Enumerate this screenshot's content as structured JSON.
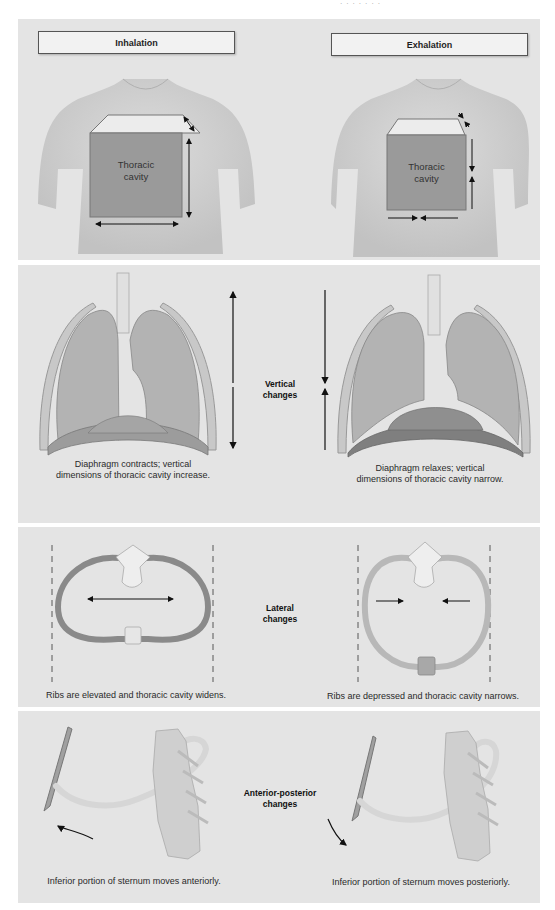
{
  "header_fragment": "· · · · · · ·",
  "sections": {
    "dimensions": {
      "inhalation_label": "Inhalation",
      "exhalation_label": "Exhalation",
      "inhalation_box_text": [
        "Thoracic",
        "cavity"
      ],
      "exhalation_box_text": [
        "Thoracic",
        "cavity"
      ]
    },
    "vertical": {
      "center_label": [
        "Vertical",
        "changes"
      ],
      "left_caption": [
        "Diaphragm contracts; vertical",
        "dimensions of thoracic cavity increase."
      ],
      "right_caption": [
        "Diaphragm relaxes; vertical",
        "dimensions of thoracic cavity narrow."
      ]
    },
    "lateral": {
      "center_label": [
        "Lateral",
        "changes"
      ],
      "left_caption": "Ribs are elevated and thoracic cavity widens.",
      "right_caption": "Ribs are depressed and thoracic cavity narrows."
    },
    "anterior_posterior": {
      "center_label": [
        "Anterior-posterior",
        "changes"
      ],
      "left_caption": "Inferior portion of sternum moves anteriorly.",
      "right_caption": "Inferior portion of sternum moves posteriorly."
    }
  },
  "colors": {
    "panel_bg": "#e4e4e4",
    "cavity_box": "#9a9a9a",
    "skin": "#d2d2d2",
    "arrow": "#111111",
    "rib_dark": "#8a8a8a",
    "rib_light": "#b8b8b8",
    "bone": "#eeeeee"
  }
}
